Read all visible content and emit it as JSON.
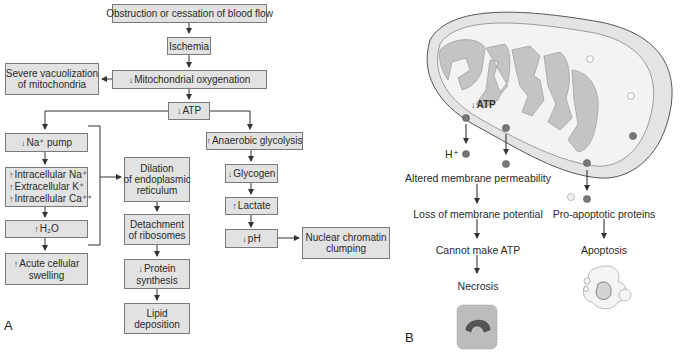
{
  "panel_a": {
    "letter": "A",
    "boxes": {
      "obstruction": "Obstruction or cessation of blood flow",
      "ischemia": "Ischemia",
      "mito_oxy": "Mitochondrial oxygenation",
      "mito_oxy_arrow": "↓",
      "vacuolization_1": "Severe vacuolization",
      "vacuolization_2": "of mitochondria",
      "atp": "ATP",
      "atp_arrow": "↓",
      "na_pump": "Na⁺ pump",
      "na_pump_arrow": "↓",
      "ions": [
        {
          "arrow": "↑",
          "text": "Intracellular Na⁺"
        },
        {
          "arrow": "↑",
          "text": "Extracellular K⁺"
        },
        {
          "arrow": "↑",
          "text": "Intracellular Ca⁺⁺"
        }
      ],
      "h2o": "H₂O",
      "h2o_arrow": "↑",
      "swelling_1": "Acute cellular",
      "swelling_2": "swelling",
      "swelling_arrow": "↑",
      "dilation": [
        "Dilation",
        "of endoplasmic",
        "reticulum"
      ],
      "detachment": [
        "Detachment",
        "of ribosomes"
      ],
      "protein_1": "Protein",
      "protein_2": "synthesis",
      "protein_arrow": "↓",
      "lipid": [
        "Lipid",
        "deposition"
      ],
      "anaerobic": "Anaerobic glycolysis",
      "anaerobic_arrow": "↑",
      "glycogen": "Glycogen",
      "glycogen_arrow": "↓",
      "lactate": "Lactate",
      "lactate_arrow": "↑",
      "ph": "pH",
      "ph_arrow": "↓",
      "chromatin": [
        "Nuclear chromatin",
        "clumping"
      ]
    }
  },
  "panel_b": {
    "letter": "B",
    "atp_label": "ATP",
    "atp_arrow": "↓",
    "h_plus": "H⁺",
    "steps_left": [
      "Altered membrane permeability",
      "Loss of membrane potential",
      "Cannot make ATP",
      "Necrosis"
    ],
    "steps_right": [
      "Pro-apoptotic proteins",
      "Apoptosis"
    ]
  },
  "colors": {
    "box_fill": "#e2e2e2",
    "box_border": "#7a7a7a",
    "mito_outer": "#e6e6e6",
    "mito_inner": "#c4c4c4",
    "line": "#333333"
  }
}
